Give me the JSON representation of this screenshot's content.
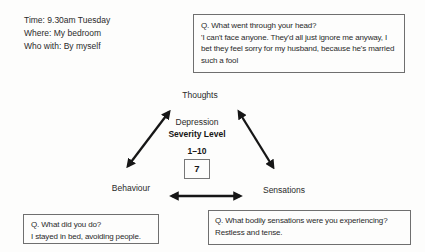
{
  "context": {
    "time": "Time: 9.30am Tuesday",
    "where": "Where: My bedroom",
    "who_with": "Who with: By myself"
  },
  "thoughts_box": {
    "question": "Q. What went through your head?",
    "answer": "'I can't face anyone. They'd all just ignore me anyway, I bet they feel sorry for my husband, because he's married such a fool"
  },
  "behaviour_box": {
    "question": "Q. What did you do?",
    "answer": "I stayed in bed, avoiding people."
  },
  "sensations_box": {
    "question": "Q. What bodily sensations were you experiencing?",
    "answer": "Restless and tense."
  },
  "diagram": {
    "thoughts": "Thoughts",
    "behaviour": "Behaviour",
    "sensations": "Sensations",
    "center": {
      "line1": "Depression",
      "line2": "Severity Level",
      "scale": "1–10",
      "rating": "7"
    }
  },
  "colors": {
    "ink": "#2a2a2a",
    "arrow": "#161616",
    "box_border": "#6f6f6f",
    "background": "#fdfdfc"
  }
}
